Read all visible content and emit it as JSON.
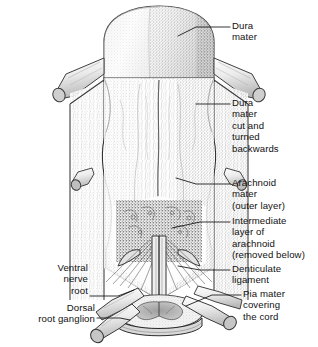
{
  "figure": {
    "type": "anatomical-line-illustration",
    "background_color": "#ffffff",
    "ink_color": "#111111"
  },
  "labels": [
    {
      "id": "dura-mater-top",
      "text": "Dura\nmater",
      "side": "right",
      "x": 232,
      "y": 20,
      "leader": [
        [
          230,
          27
        ],
        [
          196,
          27
        ],
        [
          178,
          36
        ]
      ]
    },
    {
      "id": "dura-mater-cut",
      "text": "Dura\nmater\ncut and\nturned\nbackwards",
      "side": "right",
      "x": 232,
      "y": 97,
      "leader": [
        [
          230,
          104
        ],
        [
          196,
          104
        ]
      ]
    },
    {
      "id": "arachnoid-mater-outer",
      "text": "Arachnoid\nmater\n(outer layer)",
      "side": "right",
      "x": 232,
      "y": 177,
      "leader": [
        [
          230,
          184
        ],
        [
          196,
          184
        ],
        [
          176,
          178
        ]
      ]
    },
    {
      "id": "intermediate-arachnoid",
      "text": "Intermediate\nlayer of\narachnoid\n(removed below)",
      "side": "right",
      "x": 232,
      "y": 215,
      "leader": [
        [
          230,
          222
        ],
        [
          200,
          222
        ],
        [
          172,
          228
        ]
      ]
    },
    {
      "id": "denticulate-ligament",
      "text": "Denticulate\nligament",
      "side": "right",
      "x": 232,
      "y": 263,
      "leader": [
        [
          230,
          270
        ],
        [
          200,
          270
        ],
        [
          178,
          266
        ]
      ]
    },
    {
      "id": "pia-mater",
      "text": "Pia mater\ncovering\nthe cord",
      "side": "right",
      "x": 243,
      "y": 288,
      "leader": [
        [
          241,
          295
        ],
        [
          212,
          295
        ],
        [
          186,
          306
        ]
      ]
    },
    {
      "id": "ventral-nerve-root",
      "text": "Ventral\nnerve\nroot",
      "side": "left",
      "x": 13,
      "y": 262,
      "right_edge": 88,
      "leader": [
        [
          90,
          296
        ],
        [
          118,
          296
        ],
        [
          134,
          290
        ]
      ]
    },
    {
      "id": "dorsal-root-ganglion",
      "text": "Dorsal\nroot ganglion",
      "side": "left",
      "x": 6,
      "y": 302,
      "right_edge": 95,
      "leader": [
        [
          97,
          318
        ],
        [
          120,
          318
        ],
        [
          130,
          320
        ]
      ]
    }
  ]
}
